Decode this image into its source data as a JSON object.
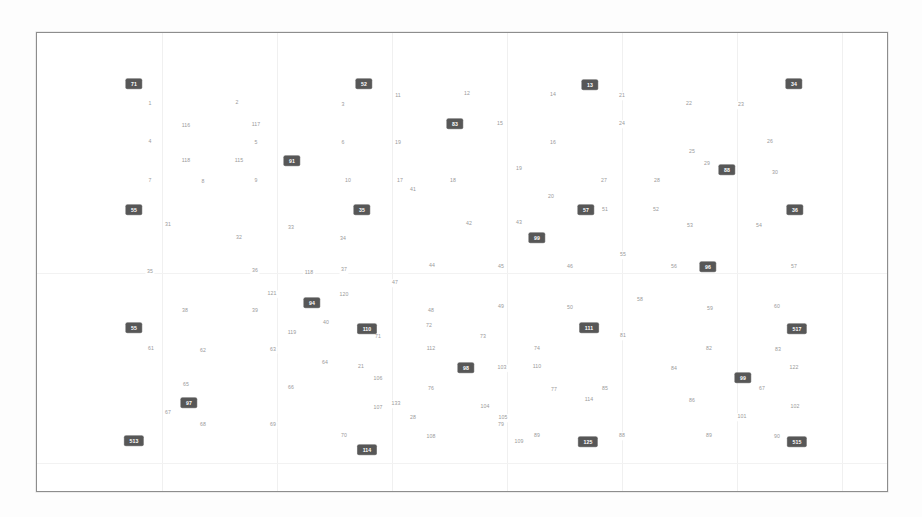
{
  "figure": {
    "background_color": "#fdfdfd",
    "plot_background_color": "#ffffff",
    "frame_color": "#8d8d8d",
    "plain_label_color": "#9a9a9a",
    "boxed_label_bg": "#575757",
    "boxed_label_color": "#ffffff",
    "grid_color": "#f0f0f0"
  },
  "chart_data": {
    "type": "scatter",
    "title": "",
    "subtitle": "",
    "xlabel": "",
    "ylabel": "",
    "xlim": [
      0,
      852
    ],
    "ylim": [
      0,
      460
    ],
    "grid": true,
    "legend": "none",
    "annotations": "Each point is rendered only as its numeric text label; highlighted nodes use a dark filled box with white text.",
    "note": "Coordinates are given in plot-frame pixel space (origin at frame top-left, 852x460).",
    "gridlines": {
      "vertical_x": [
        125,
        240,
        355,
        470,
        585,
        700,
        805
      ],
      "horizontal_y": [
        240,
        430
      ]
    },
    "series": [
      {
        "name": "plain",
        "style": "text-only",
        "points": [
          {
            "label": "1",
            "x": 113,
            "y": 71
          },
          {
            "label": "2",
            "x": 200,
            "y": 70
          },
          {
            "label": "3",
            "x": 306,
            "y": 72
          },
          {
            "label": "11",
            "x": 361,
            "y": 63
          },
          {
            "label": "12",
            "x": 430,
            "y": 61
          },
          {
            "label": "14",
            "x": 516,
            "y": 62
          },
          {
            "label": "21",
            "x": 585,
            "y": 63
          },
          {
            "label": "22",
            "x": 652,
            "y": 71
          },
          {
            "label": "23",
            "x": 704,
            "y": 72
          },
          {
            "label": "116",
            "x": 149,
            "y": 93
          },
          {
            "label": "117",
            "x": 219,
            "y": 92
          },
          {
            "label": "15",
            "x": 463,
            "y": 91
          },
          {
            "label": "24",
            "x": 585,
            "y": 91
          },
          {
            "label": "4",
            "x": 113,
            "y": 109
          },
          {
            "label": "5",
            "x": 219,
            "y": 110
          },
          {
            "label": "6",
            "x": 306,
            "y": 110
          },
          {
            "label": "19",
            "x": 361,
            "y": 110
          },
          {
            "label": "16",
            "x": 516,
            "y": 110
          },
          {
            "label": "25",
            "x": 655,
            "y": 119
          },
          {
            "label": "26",
            "x": 733,
            "y": 109
          },
          {
            "label": "118",
            "x": 149,
            "y": 128
          },
          {
            "label": "115",
            "x": 202,
            "y": 128
          },
          {
            "label": "29",
            "x": 670,
            "y": 131
          },
          {
            "label": "7",
            "x": 113,
            "y": 148
          },
          {
            "label": "8",
            "x": 166,
            "y": 149
          },
          {
            "label": "9",
            "x": 219,
            "y": 148
          },
          {
            "label": "10",
            "x": 311,
            "y": 148
          },
          {
            "label": "17",
            "x": 363,
            "y": 148
          },
          {
            "label": "18",
            "x": 416,
            "y": 148
          },
          {
            "label": "19",
            "x": 482,
            "y": 136
          },
          {
            "label": "27",
            "x": 567,
            "y": 148
          },
          {
            "label": "28",
            "x": 620,
            "y": 148
          },
          {
            "label": "30",
            "x": 738,
            "y": 140
          },
          {
            "label": "20",
            "x": 514,
            "y": 164
          },
          {
            "label": "51",
            "x": 568,
            "y": 177
          },
          {
            "label": "52",
            "x": 619,
            "y": 177
          },
          {
            "label": "41",
            "x": 376,
            "y": 157
          },
          {
            "label": "31",
            "x": 131,
            "y": 192
          },
          {
            "label": "32",
            "x": 202,
            "y": 205
          },
          {
            "label": "33",
            "x": 254,
            "y": 195
          },
          {
            "label": "34",
            "x": 306,
            "y": 206
          },
          {
            "label": "42",
            "x": 432,
            "y": 191
          },
          {
            "label": "43",
            "x": 482,
            "y": 190
          },
          {
            "label": "53",
            "x": 653,
            "y": 193
          },
          {
            "label": "54",
            "x": 722,
            "y": 193
          },
          {
            "label": "35",
            "x": 113,
            "y": 239
          },
          {
            "label": "36",
            "x": 218,
            "y": 238
          },
          {
            "label": "118",
            "x": 272,
            "y": 240
          },
          {
            "label": "37",
            "x": 307,
            "y": 237
          },
          {
            "label": "44",
            "x": 395,
            "y": 233
          },
          {
            "label": "45",
            "x": 464,
            "y": 234
          },
          {
            "label": "46",
            "x": 533,
            "y": 234
          },
          {
            "label": "55",
            "x": 586,
            "y": 222
          },
          {
            "label": "56",
            "x": 637,
            "y": 234
          },
          {
            "label": "57",
            "x": 757,
            "y": 234
          },
          {
            "label": "121",
            "x": 235,
            "y": 261
          },
          {
            "label": "120",
            "x": 307,
            "y": 262
          },
          {
            "label": "47",
            "x": 358,
            "y": 250
          },
          {
            "label": "38",
            "x": 148,
            "y": 278
          },
          {
            "label": "39",
            "x": 218,
            "y": 278
          },
          {
            "label": "40",
            "x": 289,
            "y": 290
          },
          {
            "label": "48",
            "x": 394,
            "y": 278
          },
          {
            "label": "49",
            "x": 464,
            "y": 274
          },
          {
            "label": "50",
            "x": 533,
            "y": 275
          },
          {
            "label": "58",
            "x": 603,
            "y": 267
          },
          {
            "label": "59",
            "x": 673,
            "y": 276
          },
          {
            "label": "60",
            "x": 740,
            "y": 274
          },
          {
            "label": "119",
            "x": 255,
            "y": 300
          },
          {
            "label": "61",
            "x": 114,
            "y": 316
          },
          {
            "label": "62",
            "x": 166,
            "y": 318
          },
          {
            "label": "63",
            "x": 236,
            "y": 317
          },
          {
            "label": "71",
            "x": 341,
            "y": 304
          },
          {
            "label": "72",
            "x": 392,
            "y": 293
          },
          {
            "label": "73",
            "x": 446,
            "y": 304
          },
          {
            "label": "74",
            "x": 500,
            "y": 316
          },
          {
            "label": "81",
            "x": 586,
            "y": 303
          },
          {
            "label": "82",
            "x": 672,
            "y": 316
          },
          {
            "label": "83",
            "x": 741,
            "y": 317
          },
          {
            "label": "112",
            "x": 394,
            "y": 316
          },
          {
            "label": "64",
            "x": 288,
            "y": 330
          },
          {
            "label": "21",
            "x": 324,
            "y": 334
          },
          {
            "label": "106",
            "x": 341,
            "y": 346
          },
          {
            "label": "103",
            "x": 465,
            "y": 335
          },
          {
            "label": "110",
            "x": 500,
            "y": 334
          },
          {
            "label": "84",
            "x": 637,
            "y": 336
          },
          {
            "label": "122",
            "x": 757,
            "y": 335
          },
          {
            "label": "65",
            "x": 149,
            "y": 352
          },
          {
            "label": "66",
            "x": 254,
            "y": 355
          },
          {
            "label": "76",
            "x": 394,
            "y": 356
          },
          {
            "label": "77",
            "x": 517,
            "y": 357
          },
          {
            "label": "85",
            "x": 568,
            "y": 356
          },
          {
            "label": "67",
            "x": 725,
            "y": 356
          },
          {
            "label": "86",
            "x": 655,
            "y": 368
          },
          {
            "label": "133",
            "x": 359,
            "y": 371
          },
          {
            "label": "104",
            "x": 448,
            "y": 374
          },
          {
            "label": "114",
            "x": 552,
            "y": 367
          },
          {
            "label": "107",
            "x": 341,
            "y": 375
          },
          {
            "label": "67",
            "x": 131,
            "y": 380
          },
          {
            "label": "68",
            "x": 166,
            "y": 392
          },
          {
            "label": "28",
            "x": 376,
            "y": 385
          },
          {
            "label": "105",
            "x": 466,
            "y": 385
          },
          {
            "label": "102",
            "x": 758,
            "y": 374
          },
          {
            "label": "69",
            "x": 236,
            "y": 392
          },
          {
            "label": "79",
            "x": 464,
            "y": 392
          },
          {
            "label": "101",
            "x": 705,
            "y": 384
          },
          {
            "label": "70",
            "x": 307,
            "y": 403
          },
          {
            "label": "108",
            "x": 394,
            "y": 404
          },
          {
            "label": "109",
            "x": 482,
            "y": 409
          },
          {
            "label": "89",
            "x": 500,
            "y": 403
          },
          {
            "label": "88",
            "x": 585,
            "y": 403
          },
          {
            "label": "89",
            "x": 672,
            "y": 403
          },
          {
            "label": "90",
            "x": 740,
            "y": 404
          }
        ]
      },
      {
        "name": "highlighted",
        "style": "boxed",
        "points": [
          {
            "label": "71",
            "x": 97,
            "y": 51
          },
          {
            "label": "52",
            "x": 327,
            "y": 51
          },
          {
            "label": "13",
            "x": 553,
            "y": 52
          },
          {
            "label": "34",
            "x": 757,
            "y": 51
          },
          {
            "label": "83",
            "x": 418,
            "y": 91
          },
          {
            "label": "91",
            "x": 255,
            "y": 128
          },
          {
            "label": "88",
            "x": 690,
            "y": 137
          },
          {
            "label": "55",
            "x": 97,
            "y": 177
          },
          {
            "label": "35",
            "x": 325,
            "y": 177
          },
          {
            "label": "57",
            "x": 549,
            "y": 177
          },
          {
            "label": "36",
            "x": 758,
            "y": 177
          },
          {
            "label": "99",
            "x": 500,
            "y": 205
          },
          {
            "label": "94",
            "x": 275,
            "y": 270
          },
          {
            "label": "96",
            "x": 671,
            "y": 234
          },
          {
            "label": "55",
            "x": 97,
            "y": 295
          },
          {
            "label": "110",
            "x": 330,
            "y": 296
          },
          {
            "label": "111",
            "x": 552,
            "y": 295
          },
          {
            "label": "517",
            "x": 760,
            "y": 296
          },
          {
            "label": "98",
            "x": 429,
            "y": 335
          },
          {
            "label": "99",
            "x": 706,
            "y": 345
          },
          {
            "label": "97",
            "x": 152,
            "y": 370
          },
          {
            "label": "513",
            "x": 97,
            "y": 408
          },
          {
            "label": "114",
            "x": 330,
            "y": 417
          },
          {
            "label": "125",
            "x": 551,
            "y": 409
          },
          {
            "label": "515",
            "x": 760,
            "y": 409
          }
        ]
      }
    ]
  }
}
